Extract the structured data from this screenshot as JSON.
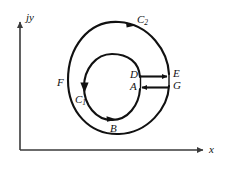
{
  "figure": {
    "background_color": "#ffffff",
    "stroke_color": "#111111",
    "axis_color": "#3a3a3a",
    "axes": {
      "vertical_label": "jy",
      "horizontal_label": "x",
      "origin": {
        "x": 20,
        "y": 150
      },
      "vertical_top": {
        "x": 20,
        "y": 20
      },
      "horizontal_right": {
        "x": 206,
        "y": 150
      }
    },
    "contours": {
      "outer": {
        "name": "C2",
        "label": "C₂",
        "label_main": "C",
        "label_sub": "2",
        "center": {
          "x": 119,
          "y": 78
        },
        "radius_x": 51,
        "radius_y": 56,
        "direction": "counterclockwise",
        "gap_side": "right"
      },
      "inner": {
        "name": "C1",
        "label": "C₁",
        "label_main": "C",
        "label_sub": "1",
        "center": {
          "x": 112,
          "y": 87
        },
        "radius_x": 28,
        "radius_y": 33,
        "direction": "clockwise",
        "gap_side": "right"
      }
    },
    "points": [
      {
        "name": "D",
        "label": "D",
        "x": 140,
        "y": 77,
        "lx": 131,
        "ly": 70
      },
      {
        "name": "E",
        "label": "E",
        "x": 169,
        "y": 74,
        "lx": 173,
        "ly": 69
      },
      {
        "name": "A",
        "label": "A",
        "x": 140,
        "y": 88,
        "lx": 131,
        "ly": 81
      },
      {
        "name": "G",
        "label": "G",
        "x": 169,
        "y": 85,
        "lx": 173,
        "ly": 80
      },
      {
        "name": "F",
        "label": "F",
        "x": 70,
        "y": 82,
        "lx": 57,
        "ly": 78
      },
      {
        "name": "B",
        "label": "B",
        "x": 113,
        "y": 120,
        "lx": 110,
        "ly": 124
      }
    ],
    "segments": [
      {
        "name": "D-to-E",
        "from": "D",
        "to": "E",
        "arrow": "right",
        "x1": 140,
        "y1": 76,
        "x2": 169,
        "y2": 76
      },
      {
        "name": "G-to-A",
        "from": "G",
        "to": "A",
        "arrow": "left",
        "x1": 169,
        "y1": 87,
        "x2": 140,
        "y2": 87
      }
    ],
    "arrow_markers": [
      {
        "name": "outer-top-arrow",
        "on": "C2",
        "at_angle_deg": 55,
        "direction": "counterclockwise"
      },
      {
        "name": "inner-left-arrow",
        "on": "C1",
        "at_angle_deg": 180,
        "direction": "clockwise"
      },
      {
        "name": "inner-bottom-arrow",
        "on": "C1",
        "at_angle_deg": 285,
        "direction": "clockwise"
      }
    ]
  }
}
